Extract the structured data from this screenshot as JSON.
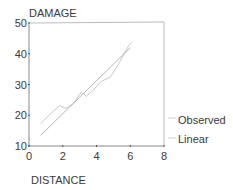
{
  "chart_data": {
    "type": "line",
    "title": "",
    "ylabel": "DAMAGE",
    "xlabel": "DISTANCE",
    "xlim": [
      0,
      8
    ],
    "ylim": [
      10,
      50
    ],
    "xticks": [
      "0",
      "2",
      "4",
      "6",
      "8"
    ],
    "yticks": [
      "10",
      "20",
      "30",
      "40",
      "50"
    ],
    "grid": false,
    "legend_position": "right",
    "series": [
      {
        "name": "Observed",
        "color": "#c8c8c8",
        "x": [
          0.7,
          1.1,
          1.8,
          2.2,
          2.6,
          3.1,
          3.4,
          3.8,
          4.3,
          4.8,
          5.2,
          5.9,
          6.1
        ],
        "y": [
          17.3,
          19.6,
          23.1,
          22.3,
          23.6,
          27.5,
          26.2,
          28.1,
          31.1,
          32.3,
          35.7,
          42.6,
          43.8
        ]
      },
      {
        "name": "Linear",
        "color": "#b4b4b4",
        "x": [
          0.7,
          6.0
        ],
        "y": [
          13.5,
          42.0
        ]
      }
    ]
  },
  "legend": {
    "items": [
      {
        "label": "Observed"
      },
      {
        "label": "Linear"
      }
    ]
  }
}
